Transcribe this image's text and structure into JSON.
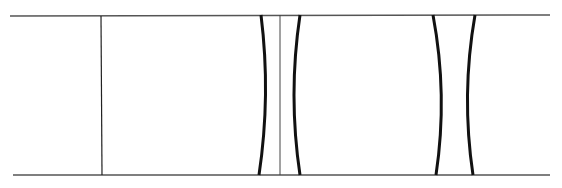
{
  "diagram": {
    "width": 562,
    "height": 188,
    "colors": {
      "background": "#ffffff",
      "stroke": "#1a1a1a",
      "thin": "#333333"
    },
    "rails": [
      {
        "name": "top-rail",
        "x1": 10,
        "x2": 550,
        "y": 16
      },
      {
        "name": "bottom-rail",
        "x1": 13,
        "x2": 550,
        "y": 175
      }
    ],
    "dividers": [
      {
        "name": "divider-left",
        "x": 102
      },
      {
        "name": "divider-center",
        "x": 280
      }
    ],
    "curves": [
      {
        "name": "curve-a-right-bow",
        "x_end": 261,
        "x_mid": 266
      },
      {
        "name": "curve-a-left-bow",
        "x_end": 300,
        "x_mid": 293
      },
      {
        "name": "curve-b-right-bow",
        "x_end": 434,
        "x_mid": 441
      },
      {
        "name": "curve-b-left-bow",
        "x_end": 474,
        "x_mid": 468
      }
    ]
  }
}
